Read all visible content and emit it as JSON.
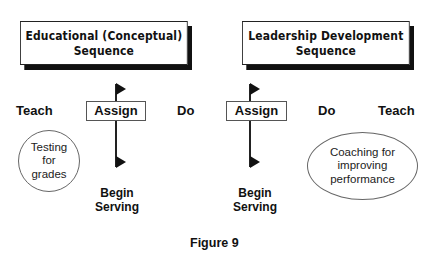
{
  "diagram": {
    "left_panel": {
      "title_line1": "Educational (Conceptual)",
      "title_line2": "Sequence",
      "steps": [
        "Teach",
        "Assign",
        "Do"
      ],
      "milestone": {
        "line1": "Begin",
        "line2": "Serving"
      },
      "bubble": {
        "line1": "Testing",
        "line2": "for",
        "line3": "grades"
      }
    },
    "right_panel": {
      "title_line1": "Leadership Development",
      "title_line2": "Sequence",
      "steps": [
        "Assign",
        "Do",
        "Teach"
      ],
      "milestone": {
        "line1": "Begin",
        "line2": "Serving"
      },
      "bubble": {
        "line1": "Coaching for",
        "line2": "improving",
        "line3": "performance"
      }
    },
    "caption": "Figure 9"
  }
}
